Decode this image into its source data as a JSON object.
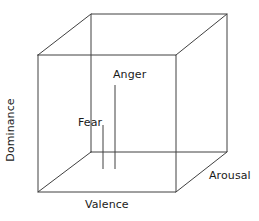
{
  "figure": {
    "type": "3d-cube-diagram",
    "background_color": "#ffffff",
    "line_color": "#404040",
    "text_color": "#1a1a1a"
  },
  "axes": {
    "dominance": {
      "label": "Dominance",
      "orientation": "vertical"
    },
    "valence": {
      "label": "Valence",
      "orientation": "horizontal"
    },
    "arousal": {
      "label": "Arousal",
      "orientation": "depth"
    }
  },
  "markers": [
    {
      "label": "Anger",
      "x": 115,
      "y_top": 85,
      "y_bottom": 169
    },
    {
      "label": "Fear",
      "x": 103,
      "y_top": 125,
      "y_bottom": 169
    }
  ],
  "cube": {
    "front_face": "38,55 176,55 176,192 38,192",
    "back_top_left": "38,55 91,14",
    "back_top_right": "176,55 227,14",
    "back_bottom_right": "176,192 227,152",
    "back_bottom_left": "38,192 91,152",
    "back_face": "91,14 227,14 227,152 91,152"
  }
}
